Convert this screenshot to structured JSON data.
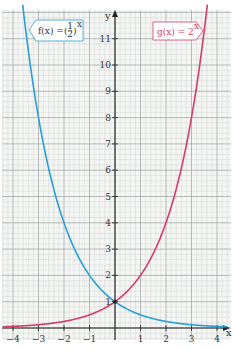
{
  "chart_data": {
    "type": "line",
    "title": "",
    "xlabel": "x",
    "ylabel": "y",
    "xlim": [
      -4.4,
      4.4
    ],
    "ylim": [
      0,
      12
    ],
    "grid": true,
    "x_ticks": [
      -4,
      -3,
      -2,
      -1,
      1,
      2,
      3,
      4
    ],
    "x_tick_labels": [
      "−4",
      "−3",
      "−2",
      "−1",
      "1",
      "2",
      "3",
      "4"
    ],
    "y_ticks": [
      1,
      2,
      3,
      4,
      5,
      6,
      7,
      8,
      9,
      10,
      11
    ],
    "y_tick_labels": [
      "1",
      "2",
      "3",
      "4",
      "5",
      "6",
      "7",
      "8",
      "9",
      "10",
      "11"
    ],
    "series": [
      {
        "name": "f(x) = (1/2)^x",
        "label_main": "f(x) = ",
        "label_base_num": "1",
        "label_base_den": "2",
        "label_exp": "x",
        "color": "#2a9fd6",
        "x": [
          -4,
          -3.5,
          -3,
          -2.5,
          -2,
          -1.5,
          -1,
          -0.5,
          0,
          0.5,
          1,
          1.5,
          2,
          2.5,
          3,
          3.5,
          4
        ],
        "values": [
          16,
          11.31,
          8,
          5.66,
          4,
          2.83,
          2,
          1.41,
          1,
          0.71,
          0.5,
          0.35,
          0.25,
          0.18,
          0.125,
          0.09,
          0.0625
        ]
      },
      {
        "name": "g(x) = 2^x",
        "label_main": "g(x) = 2",
        "label_exp": "x",
        "color": "#d63a6a",
        "x": [
          -4,
          -3.5,
          -3,
          -2.5,
          -2,
          -1.5,
          -1,
          -0.5,
          0,
          0.5,
          1,
          1.5,
          2,
          2.5,
          3,
          3.5,
          4
        ],
        "values": [
          0.0625,
          0.09,
          0.125,
          0.18,
          0.25,
          0.35,
          0.5,
          0.71,
          1,
          1.41,
          2,
          2.83,
          4,
          5.66,
          8,
          11.31,
          16
        ]
      }
    ],
    "intersection": {
      "x": 0,
      "y": 1
    }
  }
}
